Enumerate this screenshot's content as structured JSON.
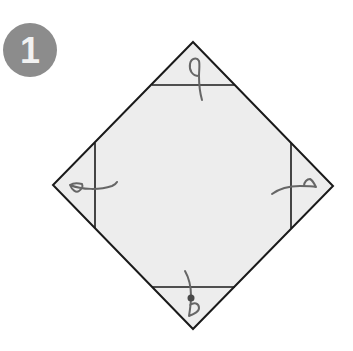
{
  "step": {
    "number": "1",
    "badge_color": "#8c8c8c",
    "number_color": "#f2f2f2"
  },
  "diagram": {
    "paper_fill": "#ededed",
    "outline_color": "#1a1a1a",
    "arrow_color": "#666666",
    "vertices": {
      "top": [
        193,
        42
      ],
      "right": [
        333,
        186
      ],
      "bottom": [
        193,
        329
      ],
      "left": [
        53,
        185
      ]
    },
    "fold_lines": [
      {
        "name": "top-fold-line",
        "from": [
          152,
          85
        ],
        "to": [
          235,
          85
        ]
      },
      {
        "name": "bottom-fold-line",
        "from": [
          152,
          287
        ],
        "to": [
          235,
          287
        ]
      },
      {
        "name": "left-fold-line",
        "from": [
          95,
          143
        ],
        "to": [
          95,
          228
        ]
      },
      {
        "name": "right-fold-line",
        "from": [
          291,
          143
        ],
        "to": [
          291,
          228
        ]
      }
    ],
    "arrows": [
      {
        "name": "top-corner-fold-arrow",
        "direction": "down"
      },
      {
        "name": "bottom-corner-fold-arrow",
        "direction": "up",
        "has_pivot_dot": true
      },
      {
        "name": "left-corner-fold-arrow",
        "direction": "right"
      },
      {
        "name": "right-corner-fold-arrow",
        "direction": "left"
      }
    ]
  }
}
